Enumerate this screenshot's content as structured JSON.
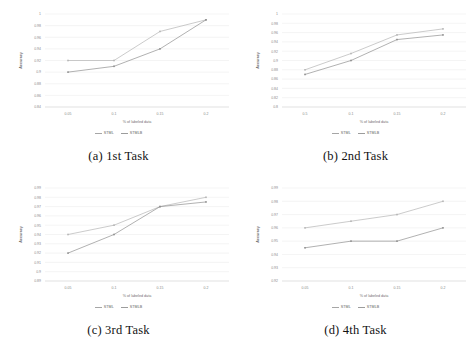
{
  "figure": {
    "legend": {
      "series": [
        {
          "name": "STML",
          "color": "#a6a6a6"
        },
        {
          "name": "STMLB",
          "color": "#9c9c9c"
        }
      ]
    },
    "axis_titles": {
      "x": "% of labeled data",
      "y": "Accuracy"
    },
    "subfigures": [
      {
        "caption": "(a) 1st Task"
      },
      {
        "caption": "(b) 2nd Task"
      },
      {
        "caption": "(c) 3rd Task"
      },
      {
        "caption": "(d) 4th Task"
      }
    ]
  },
  "chart_data": [
    {
      "type": "line",
      "title": "(a) 1st Task",
      "xlabel": "% of labeled data",
      "ylabel": "Accuracy",
      "categories": [
        "0.05",
        "0.1",
        "0.15",
        "0.2"
      ],
      "x": [
        0.05,
        0.1,
        0.15,
        0.2
      ],
      "xlim": [
        0.025,
        0.225
      ],
      "ylim": [
        0.84,
        1.0
      ],
      "yticks": [
        0.84,
        0.86,
        0.88,
        0.9,
        0.92,
        0.94,
        0.96,
        0.98,
        1
      ],
      "ytick_labels": [
        "0.84",
        "0.86",
        "0.88",
        "0.9",
        "0.92",
        "0.94",
        "0.96",
        "0.98",
        "1"
      ],
      "grid": true,
      "legend_position": "bottom",
      "series": [
        {
          "name": "STML",
          "color": "#b5b5b5",
          "values": [
            0.92,
            0.92,
            0.97,
            0.99
          ]
        },
        {
          "name": "STMLB",
          "color": "#8f8f8f",
          "values": [
            0.9,
            0.91,
            0.94,
            0.99
          ]
        }
      ]
    },
    {
      "type": "line",
      "title": "(b) 2nd Task",
      "xlabel": "% of labeled data",
      "ylabel": "Accuracy",
      "categories": [
        "0.5",
        "0.1",
        "0.15",
        "0.2"
      ],
      "x": [
        0.05,
        0.1,
        0.15,
        0.2
      ],
      "xlim": [
        0.025,
        0.225
      ],
      "ylim": [
        0.8,
        1.0
      ],
      "yticks": [
        0.8,
        0.82,
        0.84,
        0.86,
        0.88,
        0.9,
        0.92,
        0.94,
        0.96,
        0.98,
        1
      ],
      "ytick_labels": [
        "0.8",
        "0.82",
        "0.84",
        "0.86",
        "0.88",
        "0.9",
        "0.92",
        "0.94",
        "0.96",
        "0.98",
        "1"
      ],
      "grid": true,
      "legend_position": "bottom",
      "series": [
        {
          "name": "STML",
          "color": "#b5b5b5",
          "values": [
            0.88,
            0.915,
            0.955,
            0.968
          ]
        },
        {
          "name": "STMLB",
          "color": "#8f8f8f",
          "values": [
            0.87,
            0.9,
            0.945,
            0.955
          ]
        }
      ]
    },
    {
      "type": "line",
      "title": "(c) 3rd Task",
      "xlabel": "% of labeled data",
      "ylabel": "Accuracy",
      "categories": [
        "0.05",
        "0.1",
        "0.15",
        "0.2"
      ],
      "x": [
        0.05,
        0.1,
        0.15,
        0.2
      ],
      "xlim": [
        0.025,
        0.225
      ],
      "ylim": [
        0.89,
        0.99
      ],
      "yticks": [
        0.89,
        0.9,
        0.91,
        0.92,
        0.93,
        0.94,
        0.95,
        0.96,
        0.97,
        0.98,
        0.99
      ],
      "ytick_labels": [
        "0.89",
        "0.9",
        "0.91",
        "0.92",
        "0.93",
        "0.94",
        "0.95",
        "0.96",
        "0.97",
        "0.98",
        "0.99"
      ],
      "grid": true,
      "legend_position": "bottom",
      "series": [
        {
          "name": "STML",
          "color": "#b5b5b5",
          "values": [
            0.94,
            0.95,
            0.97,
            0.98
          ]
        },
        {
          "name": "STMLB",
          "color": "#8f8f8f",
          "values": [
            0.92,
            0.94,
            0.97,
            0.975
          ]
        }
      ]
    },
    {
      "type": "line",
      "title": "(d) 4th Task",
      "xlabel": "% of labeled data",
      "ylabel": "Accuracy",
      "categories": [
        "0.05",
        "0.1",
        "0.15",
        "0.2"
      ],
      "x": [
        0.05,
        0.1,
        0.15,
        0.2
      ],
      "xlim": [
        0.025,
        0.225
      ],
      "ylim": [
        0.92,
        0.99
      ],
      "yticks": [
        0.92,
        0.93,
        0.94,
        0.95,
        0.96,
        0.97,
        0.98,
        0.99
      ],
      "ytick_labels": [
        "0.92",
        "0.93",
        "0.94",
        "0.95",
        "0.96",
        "0.97",
        "0.98",
        "0.99"
      ],
      "grid": true,
      "legend_position": "bottom",
      "series": [
        {
          "name": "STML",
          "color": "#b5b5b5",
          "values": [
            0.96,
            0.965,
            0.97,
            0.98
          ]
        },
        {
          "name": "STMLB",
          "color": "#8f8f8f",
          "values": [
            0.945,
            0.95,
            0.95,
            0.96
          ]
        }
      ]
    }
  ]
}
